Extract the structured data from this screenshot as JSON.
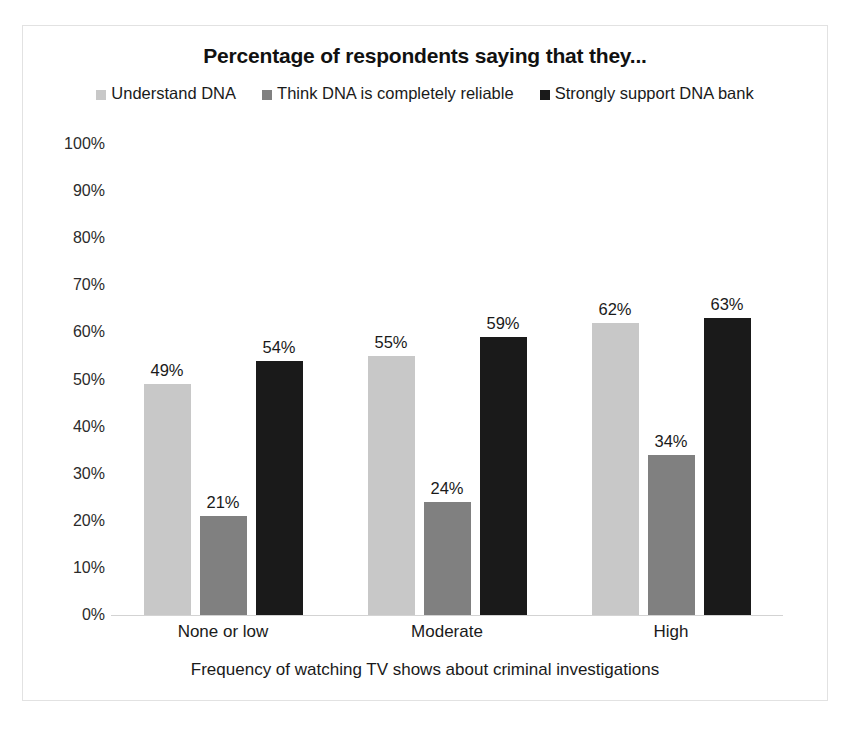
{
  "chart_data": {
    "type": "bar",
    "title": "Percentage of respondents saying that they...",
    "xlabel": "Frequency of watching TV shows about criminal investigations",
    "ylabel": "",
    "categories": [
      "None or low",
      "Moderate",
      "High"
    ],
    "series": [
      {
        "name": "Understand DNA",
        "color": "#c8c8c8",
        "values": [
          49,
          55,
          62
        ],
        "labels": [
          "49%",
          "55%",
          "62%"
        ]
      },
      {
        "name": "Think DNA is completely reliable",
        "color": "#808080",
        "values": [
          21,
          24,
          34
        ],
        "labels": [
          "21%",
          "24%",
          "34%"
        ]
      },
      {
        "name": "Strongly support DNA bank",
        "color": "#1a1a1a",
        "values": [
          54,
          59,
          63
        ],
        "labels": [
          "54%",
          "59%",
          "63%"
        ]
      }
    ],
    "ylim": [
      0,
      100
    ],
    "ytick_labels": [
      "100%",
      "90%",
      "80%",
      "70%",
      "60%",
      "50%",
      "40%",
      "30%",
      "20%",
      "10%",
      "0%"
    ],
    "ytick_values": [
      100,
      90,
      80,
      70,
      60,
      50,
      40,
      30,
      20,
      10,
      0
    ],
    "grid": false,
    "legend_position": "top",
    "value_labels": true,
    "border_color": "#e2e2e2",
    "axis_color": "#d3d3d3"
  }
}
